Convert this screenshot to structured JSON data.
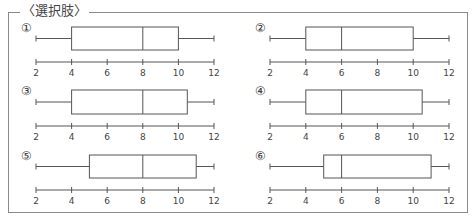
{
  "title": "〈選択肢〉",
  "chart_data": [
    {
      "type": "box",
      "label": "①",
      "min": 2,
      "q1": 4,
      "median": 8,
      "q3": 10,
      "max": 12,
      "ticks": [
        2,
        4,
        6,
        8,
        10,
        12
      ]
    },
    {
      "type": "box",
      "label": "②",
      "min": 2,
      "q1": 4,
      "median": 6,
      "q3": 10,
      "max": 12,
      "ticks": [
        2,
        4,
        6,
        8,
        10,
        12
      ]
    },
    {
      "type": "box",
      "label": "③",
      "min": 2,
      "q1": 4,
      "median": 8,
      "q3": 10.5,
      "max": 12,
      "ticks": [
        2,
        4,
        6,
        8,
        10,
        12
      ]
    },
    {
      "type": "box",
      "label": "④",
      "min": 2,
      "q1": 4,
      "median": 6,
      "q3": 10.5,
      "max": 12,
      "ticks": [
        2,
        4,
        6,
        8,
        10,
        12
      ]
    },
    {
      "type": "box",
      "label": "⑤",
      "min": 2,
      "q1": 5,
      "median": 8,
      "q3": 11,
      "max": 12,
      "ticks": [
        2,
        4,
        6,
        8,
        10,
        12
      ]
    },
    {
      "type": "box",
      "label": "⑥",
      "min": 2,
      "q1": 5,
      "median": 6,
      "q3": 11,
      "max": 12,
      "ticks": [
        2,
        4,
        6,
        8,
        10,
        12
      ]
    }
  ]
}
